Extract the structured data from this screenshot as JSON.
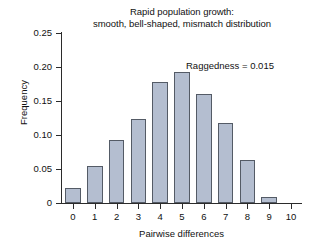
{
  "chart_data": {
    "type": "bar",
    "title": "Rapid population growth:\nsmooth, bell-shaped, mismatch distribution",
    "title_line1": "Rapid population growth:",
    "title_line2": "smooth, bell-shaped, mismatch distribution",
    "xlabel": "Pairwise differences",
    "ylabel": "Frequency",
    "categories": [
      "0",
      "1",
      "2",
      "3",
      "4",
      "5",
      "6",
      "7",
      "8",
      "9",
      "10"
    ],
    "values": [
      0.022,
      0.054,
      0.092,
      0.123,
      0.178,
      0.193,
      0.161,
      0.118,
      0.063,
      0.009,
      0.0
    ],
    "ylim": [
      0,
      0.25
    ],
    "xlim": [
      -0.5,
      10.5
    ],
    "ytick_labels": [
      "0",
      "0.05",
      "0.10",
      "0.15",
      "0.20",
      "0.25"
    ],
    "ytick_values": [
      0,
      0.05,
      0.1,
      0.15,
      0.2,
      0.25
    ],
    "xtick_labels": [
      "0",
      "1",
      "2",
      "3",
      "4",
      "5",
      "6",
      "7",
      "8",
      "9",
      "10"
    ],
    "grid": false,
    "legend": null,
    "annotations": [
      {
        "text": "Raggedness = 0.015",
        "x": 7.0,
        "y": 0.215
      }
    ],
    "bar_fill_color": "#b4bed0",
    "bar_edge_color": "#545b66",
    "axis_color": "#2b2b2b",
    "background_color": "#ffffff"
  }
}
